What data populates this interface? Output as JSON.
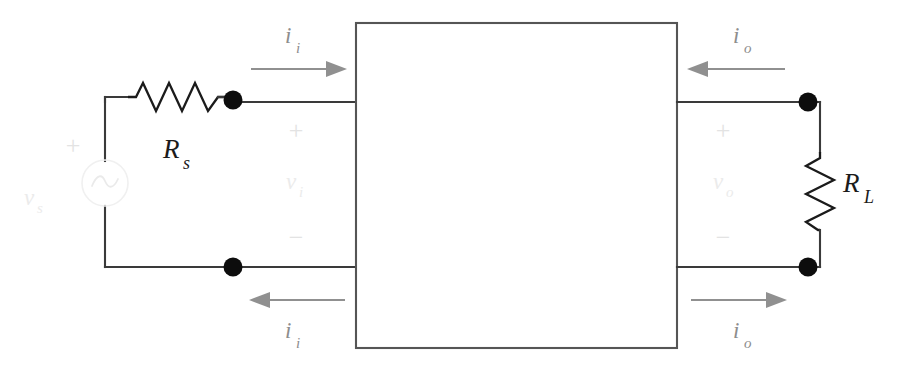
{
  "figure": {
    "kind": "two-port-network-circuit-diagram",
    "background_color": "#ffffff",
    "wire_color": "#3a3a3a",
    "arrow_color": "#909090",
    "faint_color": "#ebebeb",
    "label_color": "#1b1b1b"
  },
  "components": {
    "source": {
      "name": "ac-voltage-source",
      "symbol": "~",
      "label": "v",
      "subscript": "s",
      "polarity_plus": "+"
    },
    "source_resistor": {
      "name": "series-source-resistor",
      "label": "R",
      "subscript": "s"
    },
    "load_resistor": {
      "name": "load-resistor",
      "label": "R",
      "subscript": "L"
    },
    "network_box": {
      "name": "two-port-network-block",
      "label": ""
    }
  },
  "ports": {
    "input": {
      "voltage_label": "v",
      "voltage_subscript": "i",
      "plus_sign": "+",
      "minus_sign": "−",
      "current_label": "i",
      "current_subscript": "i",
      "top_arrow_direction": "right",
      "bottom_arrow_direction": "left"
    },
    "output": {
      "voltage_label": "v",
      "voltage_subscript": "o",
      "plus_sign": "+",
      "minus_sign": "−",
      "current_label": "i",
      "current_subscript": "o",
      "top_arrow_direction": "left",
      "bottom_arrow_direction": "right"
    }
  }
}
